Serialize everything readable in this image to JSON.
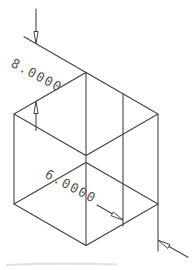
{
  "drawing": {
    "kind": "isometric-wireframe-box",
    "dimensions": [
      {
        "label": "8.0000",
        "value": 8.0
      },
      {
        "label": "6.0000",
        "value": 6.0
      }
    ],
    "icons": [
      "dimension-arrowhead-down",
      "dimension-arrowhead-up",
      "dimension-arrowhead-downright",
      "dimension-arrowhead-upleft"
    ],
    "colors": {
      "line": "#454545",
      "label": "#555555",
      "background": "#ffffff"
    }
  }
}
